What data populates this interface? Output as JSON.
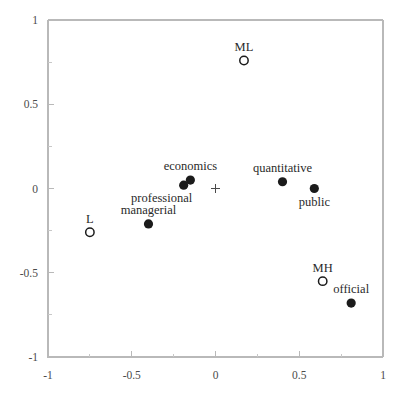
{
  "chart_data": {
    "type": "scatter",
    "title": "",
    "xlabel": "",
    "ylabel": "",
    "xlim": [
      -1,
      1
    ],
    "ylim": [
      -1,
      1
    ],
    "grid": false,
    "legend": "none",
    "x_ticks": [
      {
        "value": -1,
        "label": "-1"
      },
      {
        "value": -0.5,
        "label": "-0.5"
      },
      {
        "value": 0,
        "label": "0"
      },
      {
        "value": 0.5,
        "label": "0.5"
      },
      {
        "value": 1,
        "label": "1"
      }
    ],
    "y_ticks": [
      {
        "value": -1,
        "label": "-1"
      },
      {
        "value": -0.5,
        "label": "-0.5"
      },
      {
        "value": 0,
        "label": "0"
      },
      {
        "value": 0.5,
        "label": "0.5"
      },
      {
        "value": 1,
        "label": "1"
      }
    ],
    "x_minor_ticks": [
      -0.75,
      -0.25,
      0.25,
      0.75
    ],
    "y_minor_ticks": [
      -0.75,
      -0.25,
      0.25,
      0.75
    ],
    "origin_marker": {
      "x": 0,
      "y": 0,
      "marker": "plus",
      "color": "#4a4a4a"
    },
    "series": [
      {
        "name": "categories",
        "marker": "open-circle",
        "color": "#1b1b1b",
        "points": [
          {
            "label": "ML",
            "x": 0.17,
            "y": 0.76,
            "label_pos": "above"
          },
          {
            "label": "L",
            "x": -0.75,
            "y": -0.26,
            "label_pos": "above"
          },
          {
            "label": "MH",
            "x": 0.64,
            "y": -0.55,
            "label_pos": "above"
          }
        ]
      },
      {
        "name": "attributes",
        "marker": "filled-circle",
        "color": "#1b1b1b",
        "points": [
          {
            "label": "economics",
            "x": -0.15,
            "y": 0.05,
            "label_pos": "above"
          },
          {
            "label": "professional",
            "x": -0.19,
            "y": 0.02,
            "label_pos": "below-left"
          },
          {
            "label": "quantitative",
            "x": 0.4,
            "y": 0.04,
            "label_pos": "above"
          },
          {
            "label": "public",
            "x": 0.59,
            "y": 0.0,
            "label_pos": "below"
          },
          {
            "label": "managerial",
            "x": -0.4,
            "y": -0.21,
            "label_pos": "above"
          },
          {
            "label": "official",
            "x": 0.81,
            "y": -0.68,
            "label_pos": "above"
          }
        ]
      }
    ]
  },
  "colors": {
    "marker_fill": "#1b1b1b",
    "axis": "#b9b9b9",
    "tick_text": "#4b4b4b",
    "label_text": "#2a2a2a",
    "background": "#ffffff"
  }
}
